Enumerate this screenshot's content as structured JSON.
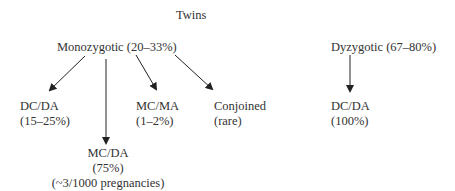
{
  "diagram": {
    "root": {
      "label": "Twins"
    },
    "branches": [
      {
        "label": "Monozygotic (20–33%)",
        "children": [
          {
            "line1": "DC/DA",
            "line2": "(15–25%)"
          },
          {
            "line1": "MC/DA",
            "line2": "(75%)",
            "line3": "(~3/1000 pregnancies)"
          },
          {
            "line1": "MC/MA",
            "line2": "(1–2%)"
          },
          {
            "line1": "Conjoined",
            "line2": "(rare)"
          }
        ]
      },
      {
        "label": "Dyzygotic (67–80%)",
        "children": [
          {
            "line1": "DC/DA",
            "line2": "(100%)"
          }
        ]
      }
    ],
    "colors": {
      "text": "#333333",
      "arrow": "#222222",
      "background": "#ffffff"
    }
  }
}
